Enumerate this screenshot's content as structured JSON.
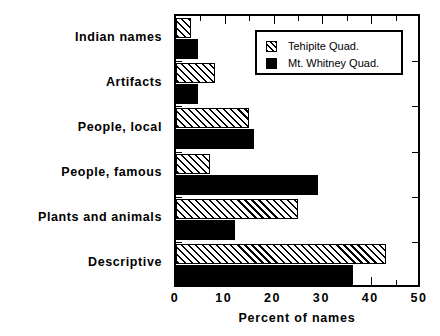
{
  "chart_data": {
    "type": "bar",
    "orientation": "horizontal",
    "title": "",
    "xlabel": "Percent of names",
    "ylabel": "",
    "xlim": [
      0,
      50
    ],
    "xticks": [
      0,
      10,
      20,
      30,
      40,
      50
    ],
    "xticklabels": [
      "0",
      "10",
      "20",
      "30",
      "40",
      "50"
    ],
    "xminorticks": [
      5,
      15,
      25,
      35,
      45
    ],
    "grid": false,
    "legend_position": "top-right",
    "categories": [
      "Indian names",
      "Artifacts",
      "People, local",
      "People, famous",
      "Plants and animals",
      "Descriptive"
    ],
    "series": [
      {
        "name": "Tehipite Quad.",
        "fill": "hatched",
        "color": "#000000",
        "values": [
          3,
          8,
          15,
          7,
          25,
          43
        ]
      },
      {
        "name": "Mt. Whitney Quad.",
        "fill": "solid",
        "color": "#000000",
        "values": [
          4.5,
          4.5,
          16,
          29,
          12,
          36.3
        ]
      }
    ]
  },
  "legend": {
    "entries": [
      {
        "label": "Tehipite Quad.",
        "swatch": "hatched"
      },
      {
        "label": "Mt. Whitney Quad.",
        "swatch": "solid"
      }
    ]
  },
  "colors": {
    "axis": "#000000",
    "background": "#ffffff",
    "series_solid": "#000000",
    "series_hatched": "#ffffff"
  }
}
